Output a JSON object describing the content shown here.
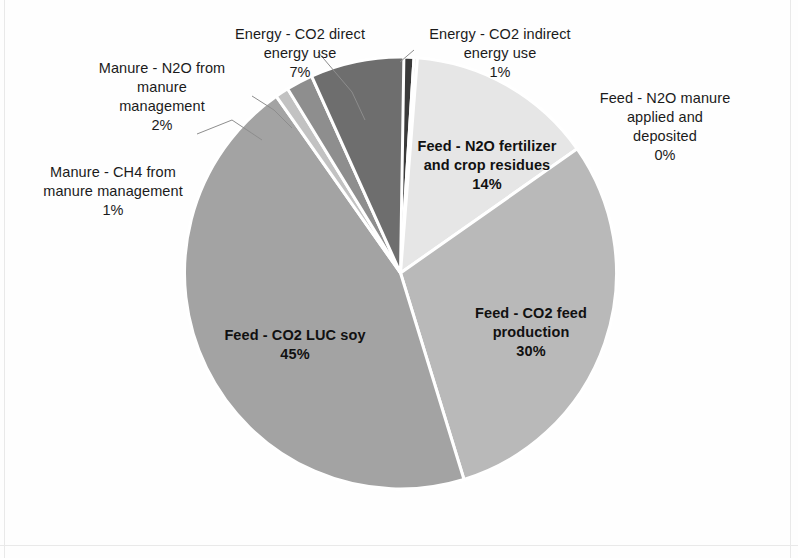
{
  "chart_data": {
    "type": "pie",
    "title": "",
    "subtitle": "",
    "xlabel": "",
    "ylabel": "",
    "legend_position": "none",
    "grid": false,
    "label_format": "name + percent",
    "start_angle_deg": 0,
    "direction": "clockwise",
    "categories": [
      "Energy - CO2 indirect energy use",
      "Feed - N2O manure applied and deposited",
      "Feed - N2O fertilizer and crop residues",
      "Feed - CO2 feed production",
      "Feed - CO2 LUC soy",
      "Manure - CH4 from manure management",
      "Manure - N2O from manure management",
      "Energy - CO2 direct energy use"
    ],
    "values": [
      1,
      0,
      14,
      30,
      45,
      1,
      2,
      7
    ],
    "value_labels": [
      "1%",
      "0%",
      "14%",
      "30%",
      "45%",
      "1%",
      "2%",
      "7%"
    ],
    "colors": [
      "#3a3a3a",
      "#cfcfcf",
      "#e6e6e6",
      "#b9b9b9",
      "#a3a3a3",
      "#c2c2c2",
      "#8e8e8e",
      "#6e6e6e"
    ],
    "slices": [
      {
        "name": "Energy - CO2 indirect energy use",
        "value": 1,
        "label": "1%",
        "color": "#3a3a3a",
        "placement": "outside"
      },
      {
        "name": "Feed - N2O manure applied and deposited",
        "value": 0,
        "label": "0%",
        "color": "#cfcfcf",
        "placement": "outside"
      },
      {
        "name": "Feed - N2O fertilizer and crop residues",
        "value": 14,
        "label": "14%",
        "color": "#e6e6e6",
        "placement": "inside"
      },
      {
        "name": "Feed - CO2 feed production",
        "value": 30,
        "label": "30%",
        "color": "#b9b9b9",
        "placement": "inside"
      },
      {
        "name": "Feed - CO2 LUC soy",
        "value": 45,
        "label": "45%",
        "color": "#a3a3a3",
        "placement": "inside"
      },
      {
        "name": "Manure - CH4 from manure management",
        "value": 1,
        "label": "1%",
        "color": "#c2c2c2",
        "placement": "outside"
      },
      {
        "name": "Manure - N2O from manure management",
        "value": 2,
        "label": "2%",
        "color": "#8e8e8e",
        "placement": "outside"
      },
      {
        "name": "Energy - CO2 direct energy use",
        "value": 7,
        "label": "7%",
        "color": "#6e6e6e",
        "placement": "outside"
      }
    ]
  },
  "labels": {
    "co2_direct": {
      "name": "Energy - CO2 direct\nenergy use",
      "pct": "7%"
    },
    "co2_indirect": {
      "name": "Energy - CO2 indirect\nenergy use",
      "pct": "1%"
    },
    "n2o_manure_applied": {
      "name": "Feed - N2O manure\napplied and\ndeposited",
      "pct": "0%"
    },
    "n2o_manure_mgmt": {
      "name": "Manure - N2O from\nmanure\nmanagement",
      "pct": "2%"
    },
    "ch4_manure_mgmt": {
      "name": "Manure - CH4 from\nmanure management",
      "pct": "1%"
    },
    "n2o_fertilizer": {
      "name": "Feed - N2O fertilizer\nand crop residues",
      "pct": "14%"
    },
    "co2_feed_production": {
      "name": "Feed - CO2 feed\nproduction",
      "pct": "30%"
    },
    "co2_luc_soy": {
      "name": "Feed - CO2 LUC soy",
      "pct": "45%"
    }
  }
}
